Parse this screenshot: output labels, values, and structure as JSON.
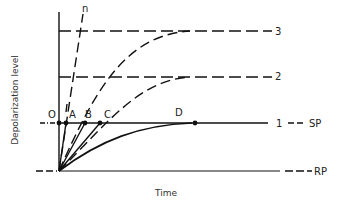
{
  "diagram": {
    "axes": {
      "y_label": "Depolarization level",
      "x_label": "Time"
    },
    "levels": [
      {
        "id": "3",
        "label": "3",
        "style": "dashed"
      },
      {
        "id": "2",
        "label": "2",
        "style": "dashed"
      },
      {
        "id": "1",
        "label": "1",
        "style": "solid"
      }
    ],
    "thresholds": {
      "sp_label": "SP",
      "rp_label": "RP"
    },
    "curves": [
      {
        "id": "n",
        "label": "n",
        "style": "dashed"
      }
    ],
    "points": [
      {
        "label": "O"
      },
      {
        "label": "A"
      },
      {
        "label": "B"
      },
      {
        "label": "C"
      },
      {
        "label": "D"
      }
    ],
    "colors": {
      "ink": "#111111",
      "text": "#333333",
      "background": "#ffffff"
    }
  }
}
